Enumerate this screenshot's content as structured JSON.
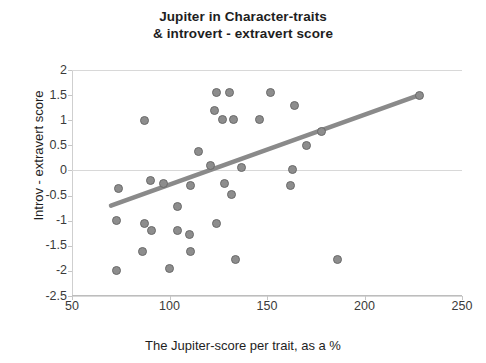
{
  "chart_data": {
    "type": "scatter",
    "title": "Jupiter in Character-traits",
    "title_line2": "& introvert - extravert  score",
    "xlabel": "The Jupiter-score per trait, as a %",
    "ylabel": "Introv - extravert score",
    "xlim": [
      50,
      250
    ],
    "ylim": [
      -2.5,
      2
    ],
    "xticks": [
      50,
      100,
      150,
      200,
      250
    ],
    "xtick_labels": [
      "50",
      "100",
      "150",
      "200",
      "250"
    ],
    "yticks": [
      2,
      1.5,
      1,
      0.5,
      0,
      -0.5,
      -1,
      -1.5,
      -2,
      -2.5
    ],
    "ytick_labels": [
      "2",
      "1.5",
      "1",
      "0.5",
      "0",
      "-0.5",
      "-1",
      "-1.5",
      "-2",
      "-2.5"
    ],
    "grid": "horizontal-faint",
    "legend": "none",
    "marker_color": "#8d8d8d",
    "marker_edge_color": "#6a6a6a",
    "trendline_color": "#8a8a8a",
    "series": [
      {
        "name": "Traits",
        "points": [
          [
            87,
            1.0
          ],
          [
            124,
            1.55
          ],
          [
            131,
            1.55
          ],
          [
            152,
            1.55
          ],
          [
            164,
            1.3
          ],
          [
            178,
            0.78
          ],
          [
            123,
            1.2
          ],
          [
            127,
            1.02
          ],
          [
            133,
            1.02
          ],
          [
            146,
            1.02
          ],
          [
            115,
            0.38
          ],
          [
            121,
            0.1
          ],
          [
            137,
            0.05
          ],
          [
            170,
            0.5
          ],
          [
            163,
            0.02
          ],
          [
            228,
            1.5
          ],
          [
            74,
            -0.35
          ],
          [
            90,
            -0.2
          ],
          [
            97,
            -0.25
          ],
          [
            104,
            -0.72
          ],
          [
            111,
            -0.3
          ],
          [
            128,
            -0.25
          ],
          [
            132,
            -0.48
          ],
          [
            162,
            -0.3
          ],
          [
            73,
            -1.0
          ],
          [
            87,
            -1.05
          ],
          [
            91,
            -1.2
          ],
          [
            104,
            -1.2
          ],
          [
            110,
            -1.28
          ],
          [
            124,
            -1.05
          ],
          [
            86,
            -1.62
          ],
          [
            111,
            -1.62
          ],
          [
            100,
            -1.95
          ],
          [
            134,
            -1.78
          ],
          [
            186,
            -1.78
          ],
          [
            73,
            -2.0
          ]
        ]
      }
    ],
    "trendline": {
      "x_start": 70,
      "y_start": -0.7,
      "x_end": 228,
      "y_end": 1.5
    }
  }
}
